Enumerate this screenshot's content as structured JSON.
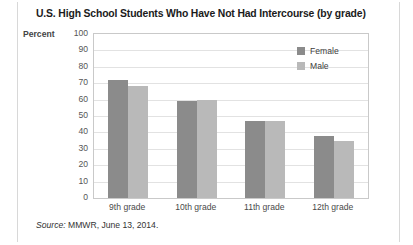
{
  "title": "U.S. High School Students Who Have Not Had Intercourse (by grade)",
  "axis": {
    "percent_label": "Percent"
  },
  "source": {
    "label": "Source:",
    "text": "MMWR, June 13, 2014."
  },
  "colors": {
    "female": "#8b8b8b",
    "male": "#b9b9b9",
    "grid": "#e2e2e2",
    "frame": "#c9c9c9"
  },
  "chart_data": {
    "type": "bar",
    "title": "U.S. High School Students Who Have Not Had Intercourse (by grade)",
    "xlabel": "",
    "ylabel": "Percent",
    "ylim": [
      0,
      100
    ],
    "yticks": [
      0,
      10,
      20,
      30,
      40,
      50,
      60,
      70,
      80,
      90,
      100
    ],
    "ytick_labels": [
      "0",
      "10",
      "20",
      "30",
      "40",
      "50",
      "60",
      "70",
      "80",
      "90",
      "100"
    ],
    "grid": true,
    "legend_position": "top-right",
    "categories": [
      "9th grade",
      "10th grade",
      "11th grade",
      "12th grade"
    ],
    "series": [
      {
        "name": "Female",
        "color": "#8b8b8b",
        "values": [
          72,
          59,
          47,
          38
        ]
      },
      {
        "name": "Male",
        "color": "#b9b9b9",
        "values": [
          68,
          60,
          47,
          35
        ]
      }
    ]
  }
}
